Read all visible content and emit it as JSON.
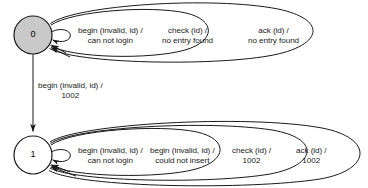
{
  "diagram": {
    "type": "finite-state-machine",
    "colors": {
      "state_filled": "#c9c9c9",
      "state_empty": "#ffffff",
      "stroke": "#1a1a1a",
      "text": "#1a1a1a",
      "background": "#ffffff"
    },
    "states": [
      {
        "id": "state-0",
        "label": "0",
        "fill": "#c9c9c9",
        "cx": 33,
        "cy": 35,
        "r": 19
      },
      {
        "id": "state-1",
        "label": "1",
        "fill": "#ffffff",
        "cx": 33,
        "cy": 155,
        "r": 19
      }
    ],
    "transitions": [
      {
        "id": "t-0-to-1",
        "from": "0",
        "to": "1",
        "event": "begin (invalid, id) /",
        "response": "1002"
      }
    ],
    "self_loops_state0": [
      {
        "id": "loop-0-begin",
        "event": "begin (invalid, id) /",
        "response": "can not login"
      },
      {
        "id": "loop-0-check",
        "event": "check (id) /",
        "response": "no entry found"
      },
      {
        "id": "loop-0-ack",
        "event": "ack (id) /",
        "response": "no entry found"
      }
    ],
    "self_loops_state1": [
      {
        "id": "loop-1-begin-login",
        "event": "begin (invalid, id) /",
        "response": "can not login"
      },
      {
        "id": "loop-1-begin-insert",
        "event": "begin (invalid, id) /",
        "response": "could not insert"
      },
      {
        "id": "loop-1-check",
        "event": "check (id) /",
        "response": "1002"
      },
      {
        "id": "loop-1-ack",
        "event": "ack (id) /",
        "response": "1002"
      }
    ]
  }
}
